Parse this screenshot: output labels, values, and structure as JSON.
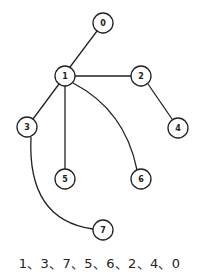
{
  "graph": {
    "nodes": [
      {
        "id": "0",
        "label": "0",
        "x": 103,
        "y": 23
      },
      {
        "id": "1",
        "label": "1",
        "x": 65,
        "y": 76
      },
      {
        "id": "2",
        "label": "2",
        "x": 141,
        "y": 76
      },
      {
        "id": "3",
        "label": "3",
        "x": 27,
        "y": 127
      },
      {
        "id": "4",
        "label": "4",
        "x": 178,
        "y": 128
      },
      {
        "id": "5",
        "label": "5",
        "x": 65,
        "y": 179
      },
      {
        "id": "6",
        "label": "6",
        "x": 141,
        "y": 179
      },
      {
        "id": "7",
        "label": "7",
        "x": 103,
        "y": 230
      }
    ],
    "edges": [
      {
        "from": "1",
        "to": "0",
        "type": "straight"
      },
      {
        "from": "1",
        "to": "2",
        "type": "straight"
      },
      {
        "from": "2",
        "to": "4",
        "type": "straight"
      },
      {
        "from": "1",
        "to": "3",
        "type": "straight"
      },
      {
        "from": "1",
        "to": "5",
        "type": "straight"
      },
      {
        "from": "1",
        "to": "6",
        "type": "curved"
      },
      {
        "from": "3",
        "to": "7",
        "type": "curved"
      }
    ]
  },
  "caption": "1、3、7、5、6、2、4、0"
}
